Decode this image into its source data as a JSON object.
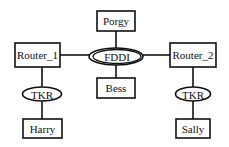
{
  "diagram": {
    "type": "network-topology",
    "nodes": {
      "porgy": {
        "label": "Porgy",
        "shape": "rectangle"
      },
      "fddi": {
        "label": "FDDI",
        "shape": "double-ellipse"
      },
      "bess": {
        "label": "Bess",
        "shape": "rectangle"
      },
      "router1": {
        "label": "Router_1",
        "shape": "rectangle"
      },
      "router2": {
        "label": "Router_2",
        "shape": "rectangle"
      },
      "tkr1": {
        "label": "TKR",
        "shape": "ellipse"
      },
      "tkr2": {
        "label": "TKR",
        "shape": "ellipse"
      },
      "harry": {
        "label": "Harry",
        "shape": "rectangle"
      },
      "sally": {
        "label": "Sally",
        "shape": "rectangle"
      }
    },
    "edges": [
      [
        "Porgy",
        "FDDI"
      ],
      [
        "FDDI",
        "Bess"
      ],
      [
        "Router_1",
        "FDDI"
      ],
      [
        "FDDI",
        "Router_2"
      ],
      [
        "Router_1",
        "TKR"
      ],
      [
        "TKR",
        "Harry"
      ],
      [
        "Router_2",
        "TKR"
      ],
      [
        "TKR",
        "Sally"
      ]
    ]
  }
}
